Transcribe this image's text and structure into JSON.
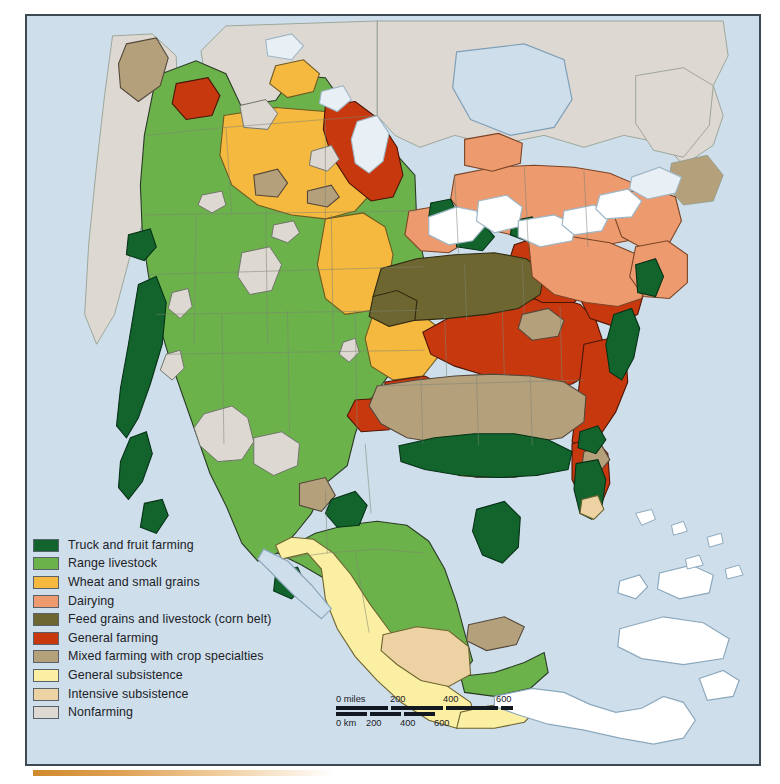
{
  "map": {
    "title": "Agricultural regions of North America",
    "ocean_color": "#cfdeeb",
    "border_color": "#3d4a52",
    "country_line_color": "#6f7b66",
    "coast_line_color": "#4a5a66"
  },
  "legend": {
    "items": [
      {
        "label": "Truck and fruit farming",
        "color": "#12642c"
      },
      {
        "label": "Range livestock",
        "color": "#6cb24a"
      },
      {
        "label": "Wheat and small grains",
        "color": "#f5b93f"
      },
      {
        "label": "Dairying",
        "color": "#ec9a6e"
      },
      {
        "label": "Feed grains and livestock (corn belt)",
        "color": "#6e6630"
      },
      {
        "label": "General farming",
        "color": "#c8380f"
      },
      {
        "label": "Mixed farming with crop specialties",
        "color": "#b5a07c"
      },
      {
        "label": "General subsistence",
        "color": "#fbefa3"
      },
      {
        "label": "Intensive subsistence",
        "color": "#edd3a4"
      },
      {
        "label": "Nonfarming",
        "color": "#ddd8d2"
      }
    ]
  },
  "scale": {
    "miles_unit": "0 miles",
    "miles_ticks": [
      "200",
      "400",
      "600"
    ],
    "km_unit": "0 km",
    "km_ticks": [
      "200",
      "400",
      "600"
    ]
  }
}
